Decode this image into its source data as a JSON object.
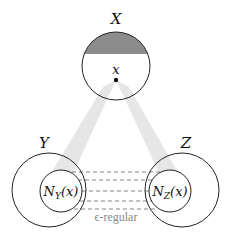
{
  "diagram": {
    "sets": {
      "X": {
        "label": "X",
        "point_label": "x"
      },
      "Y": {
        "label": "Y",
        "neighborhood_label": "N",
        "neighborhood_sub": "Y",
        "neighborhood_arg": "(x)"
      },
      "Z": {
        "label": "Z",
        "neighborhood_label": "N",
        "neighborhood_sub": "Z",
        "neighborhood_arg": "(x)"
      }
    },
    "edge_label": "ϵ-regular",
    "dashed_line_count": 5,
    "colors": {
      "stroke": "#222222",
      "cap_fill": "#8c8c8c",
      "beam_fill": "#e6e6e6",
      "dash": "#777777",
      "edge_label": "#888888"
    }
  }
}
